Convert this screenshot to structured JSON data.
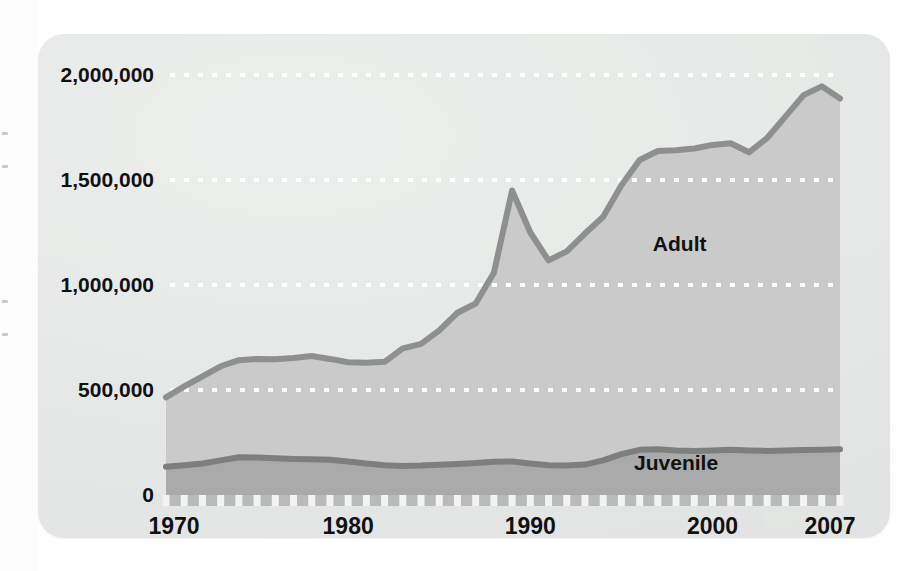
{
  "figure": {
    "background_color": "#e8eae9",
    "card_radius_px": 26
  },
  "chart_data": {
    "type": "area",
    "stacked": true,
    "title": "",
    "subtitle": "",
    "xlabel": "",
    "ylabel": "",
    "xlim": [
      1970,
      2007
    ],
    "ylim": [
      0,
      2000000
    ],
    "grid": true,
    "grid_style": "dotted-white-horizontal",
    "legend_position": "inline-annotation",
    "x": [
      1970,
      1971,
      1972,
      1973,
      1974,
      1975,
      1976,
      1977,
      1978,
      1979,
      1980,
      1981,
      1982,
      1983,
      1984,
      1985,
      1986,
      1987,
      1988,
      1989,
      1990,
      1991,
      1992,
      1993,
      1994,
      1995,
      1996,
      1997,
      1998,
      1999,
      2000,
      2001,
      2002,
      2003,
      2004,
      2005,
      2006,
      2007
    ],
    "xticks": [
      1970,
      1980,
      1990,
      2000,
      2007
    ],
    "xticklabels": [
      "1970",
      "1980",
      "1990",
      "2000",
      "2007"
    ],
    "xtick_minor_every": 1,
    "yticks": [
      0,
      500000,
      1000000,
      1500000,
      2000000
    ],
    "yticklabels": [
      "0",
      "500,000",
      "1,000,000",
      "1,500,000",
      "2,000,000"
    ],
    "series": [
      {
        "name": "Juvenile",
        "label": "Juvenile",
        "fill_color": "#a9aaa9",
        "line_color": "#7d7f7e",
        "values": [
          135000,
          142000,
          150000,
          165000,
          180000,
          178000,
          175000,
          172000,
          170000,
          168000,
          160000,
          150000,
          142000,
          138000,
          140000,
          144000,
          148000,
          152000,
          158000,
          160000,
          150000,
          142000,
          140000,
          145000,
          165000,
          195000,
          215000,
          218000,
          212000,
          210000,
          212000,
          215000,
          212000,
          210000,
          212000,
          214000,
          216000,
          218000
        ]
      },
      {
        "name": "Adult",
        "label": "Adult",
        "fill_color": "#c9cac9",
        "line_color": "#8e908f",
        "values": [
          330000,
          375000,
          415000,
          448000,
          462000,
          470000,
          472000,
          480000,
          492000,
          480000,
          472000,
          480000,
          492000,
          560000,
          580000,
          640000,
          720000,
          760000,
          900000,
          1290000,
          1100000,
          975000,
          1020000,
          1100000,
          1160000,
          1280000,
          1380000,
          1420000,
          1430000,
          1440000,
          1455000,
          1460000,
          1420000,
          1490000,
          1590000,
          1690000,
          1730000,
          1670000
        ]
      }
    ],
    "annotations": [
      {
        "text": "Adult",
        "x": 1998.2,
        "y": 1160000
      },
      {
        "text": "Juvenile",
        "x": 1998.0,
        "y": 120000
      }
    ]
  }
}
